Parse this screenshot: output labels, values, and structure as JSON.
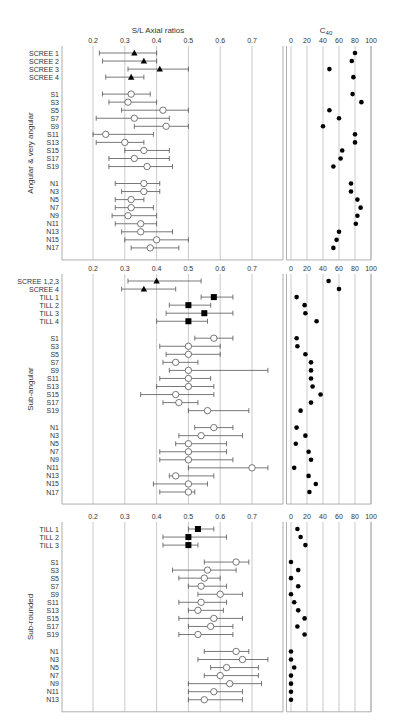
{
  "chart_data": {
    "type": "scatter",
    "title_left": "S/L Axial ratios",
    "title_right": "C40",
    "title_right_main": "C",
    "title_right_sub": "40",
    "left_axis": {
      "min": 0.2,
      "max": 0.7,
      "ticks": [
        0.2,
        0.3,
        0.4,
        0.5,
        0.6,
        0.7
      ],
      "tick_labels": [
        "0.2",
        "0.3",
        "0.4",
        "0.5",
        "0.6",
        "0.7"
      ]
    },
    "right_axis": {
      "min": 0,
      "max": 100,
      "ticks": [
        0,
        20,
        40,
        60,
        80,
        100
      ],
      "tick_labels": [
        "0",
        "20",
        "40",
        "60",
        "80",
        "100"
      ]
    },
    "grid": true,
    "marker_legend": {
      "triangle": "SCREE",
      "square": "TILL",
      "open-circle": "S / N samples",
      "dot": "C40"
    },
    "panels": [
      {
        "group_label": "Angular & very angular",
        "rows": [
          {
            "label": "SCREE 1",
            "marker": "triangle",
            "ratio": 0.33,
            "lo": 0.22,
            "hi": 0.4,
            "c40": 80
          },
          {
            "label": "SCREE 2",
            "marker": "triangle",
            "ratio": 0.36,
            "lo": 0.23,
            "hi": 0.4,
            "c40": 76
          },
          {
            "label": "SCREE 3",
            "marker": "triangle",
            "ratio": 0.41,
            "lo": 0.31,
            "hi": 0.5,
            "c40": 48
          },
          {
            "label": "SCREE 4",
            "marker": "triangle",
            "ratio": 0.32,
            "lo": 0.24,
            "hi": 0.36,
            "c40": 78
          },
          {
            "gap": true
          },
          {
            "label": "S1",
            "marker": "circle",
            "ratio": 0.32,
            "lo": 0.23,
            "hi": 0.38,
            "c40": 77
          },
          {
            "label": "S3",
            "marker": "circle",
            "ratio": 0.31,
            "lo": 0.25,
            "hi": 0.4,
            "c40": 88
          },
          {
            "label": "S5",
            "marker": "circle",
            "ratio": 0.42,
            "lo": 0.29,
            "hi": 0.5,
            "c40": 48
          },
          {
            "label": "S7",
            "marker": "circle",
            "ratio": 0.33,
            "lo": 0.21,
            "hi": 0.44,
            "c40": 60
          },
          {
            "label": "S9",
            "marker": "circle",
            "ratio": 0.43,
            "lo": 0.33,
            "hi": 0.5,
            "c40": 40
          },
          {
            "label": "S11",
            "marker": "circle",
            "ratio": 0.24,
            "lo": 0.2,
            "hi": 0.39,
            "c40": 80
          },
          {
            "label": "S13",
            "marker": "circle",
            "ratio": 0.3,
            "lo": 0.21,
            "hi": 0.36,
            "c40": 80
          },
          {
            "label": "S15",
            "marker": "circle",
            "ratio": 0.36,
            "lo": 0.3,
            "hi": 0.44,
            "c40": 64
          },
          {
            "label": "S17",
            "marker": "circle",
            "ratio": 0.33,
            "lo": 0.25,
            "hi": 0.44,
            "c40": 62
          },
          {
            "label": "S19",
            "marker": "circle",
            "ratio": 0.37,
            "lo": 0.25,
            "hi": 0.45,
            "c40": 53
          },
          {
            "gap": true
          },
          {
            "label": "N1",
            "marker": "circle",
            "ratio": 0.36,
            "lo": 0.27,
            "hi": 0.41,
            "c40": 75
          },
          {
            "label": "N3",
            "marker": "circle",
            "ratio": 0.36,
            "lo": 0.29,
            "hi": 0.41,
            "c40": 75
          },
          {
            "label": "N5",
            "marker": "circle",
            "ratio": 0.32,
            "lo": 0.27,
            "hi": 0.36,
            "c40": 83
          },
          {
            "label": "N7",
            "marker": "circle",
            "ratio": 0.32,
            "lo": 0.27,
            "hi": 0.39,
            "c40": 87
          },
          {
            "label": "N9",
            "marker": "circle",
            "ratio": 0.31,
            "lo": 0.26,
            "hi": 0.4,
            "c40": 83
          },
          {
            "label": "N11",
            "marker": "circle",
            "ratio": 0.35,
            "lo": 0.27,
            "hi": 0.4,
            "c40": 81
          },
          {
            "label": "N13",
            "marker": "circle",
            "ratio": 0.35,
            "lo": 0.29,
            "hi": 0.45,
            "c40": 60
          },
          {
            "label": "N15",
            "marker": "circle",
            "ratio": 0.4,
            "lo": 0.3,
            "hi": 0.5,
            "c40": 57
          },
          {
            "label": "N17",
            "marker": "circle",
            "ratio": 0.38,
            "lo": 0.32,
            "hi": 0.47,
            "c40": 53
          }
        ]
      },
      {
        "group_label": "Sub-angular",
        "rows": [
          {
            "label": "SCREE 1,2,3",
            "marker": "triangle",
            "ratio": 0.4,
            "lo": 0.31,
            "hi": 0.54,
            "c40": 47
          },
          {
            "label": "SCREE 4",
            "marker": "triangle",
            "ratio": 0.36,
            "lo": 0.29,
            "hi": 0.46,
            "c40": 60
          },
          {
            "label": "TILL 1",
            "marker": "square",
            "ratio": 0.58,
            "lo": 0.54,
            "hi": 0.64,
            "c40": 7
          },
          {
            "label": "TILL 2",
            "marker": "square",
            "ratio": 0.5,
            "lo": 0.44,
            "hi": 0.57,
            "c40": 17
          },
          {
            "label": "TILL 3",
            "marker": "square",
            "ratio": 0.55,
            "lo": 0.43,
            "hi": 0.64,
            "c40": 18
          },
          {
            "label": "TILL 4",
            "marker": "square",
            "ratio": 0.5,
            "lo": 0.4,
            "hi": 0.56,
            "c40": 32
          },
          {
            "gap": true
          },
          {
            "label": "S1",
            "marker": "circle",
            "ratio": 0.58,
            "lo": 0.52,
            "hi": 0.64,
            "c40": 7
          },
          {
            "label": "S3",
            "marker": "circle",
            "ratio": 0.5,
            "lo": 0.41,
            "hi": 0.6,
            "c40": 8
          },
          {
            "label": "S5",
            "marker": "circle",
            "ratio": 0.5,
            "lo": 0.43,
            "hi": 0.6,
            "c40": 18
          },
          {
            "label": "S7",
            "marker": "circle",
            "ratio": 0.46,
            "lo": 0.42,
            "hi": 0.53,
            "c40": 25
          },
          {
            "label": "S9",
            "marker": "circle",
            "ratio": 0.5,
            "lo": 0.44,
            "hi": 0.75,
            "c40": 25
          },
          {
            "label": "S11",
            "marker": "circle",
            "ratio": 0.5,
            "lo": 0.41,
            "hi": 0.57,
            "c40": 25
          },
          {
            "label": "S13",
            "marker": "circle",
            "ratio": 0.5,
            "lo": 0.4,
            "hi": 0.58,
            "c40": 27
          },
          {
            "label": "S15",
            "marker": "circle",
            "ratio": 0.46,
            "lo": 0.35,
            "hi": 0.58,
            "c40": 37
          },
          {
            "label": "S17",
            "marker": "circle",
            "ratio": 0.47,
            "lo": 0.42,
            "hi": 0.53,
            "c40": 25
          },
          {
            "label": "S19",
            "marker": "circle",
            "ratio": 0.56,
            "lo": 0.5,
            "hi": 0.69,
            "c40": 12
          },
          {
            "gap": true
          },
          {
            "label": "N1",
            "marker": "circle",
            "ratio": 0.58,
            "lo": 0.52,
            "hi": 0.64,
            "c40": 7
          },
          {
            "label": "N3",
            "marker": "circle",
            "ratio": 0.54,
            "lo": 0.47,
            "hi": 0.67,
            "c40": 18
          },
          {
            "label": "N5",
            "marker": "circle",
            "ratio": 0.5,
            "lo": 0.46,
            "hi": 0.62,
            "c40": 6
          },
          {
            "label": "N7",
            "marker": "circle",
            "ratio": 0.5,
            "lo": 0.41,
            "hi": 0.62,
            "c40": 22
          },
          {
            "label": "N9",
            "marker": "circle",
            "ratio": 0.5,
            "lo": 0.41,
            "hi": 0.64,
            "c40": 25
          },
          {
            "label": "N11",
            "marker": "circle",
            "ratio": 0.7,
            "lo": 0.5,
            "hi": 0.75,
            "c40": 4
          },
          {
            "label": "N13",
            "marker": "circle",
            "ratio": 0.46,
            "lo": 0.44,
            "hi": 0.58,
            "c40": 22
          },
          {
            "label": "N15",
            "marker": "circle",
            "ratio": 0.5,
            "lo": 0.39,
            "hi": 0.56,
            "c40": 31
          },
          {
            "label": "N17",
            "marker": "circle",
            "ratio": 0.5,
            "lo": 0.41,
            "hi": 0.52,
            "c40": 23
          }
        ]
      },
      {
        "group_label": "Sub-rounded",
        "rows": [
          {
            "label": "TILL 1",
            "marker": "square",
            "ratio": 0.53,
            "lo": 0.5,
            "hi": 0.58,
            "c40": 8
          },
          {
            "label": "TILL 2",
            "marker": "square",
            "ratio": 0.5,
            "lo": 0.42,
            "hi": 0.62,
            "c40": 12
          },
          {
            "label": "TILL 3",
            "marker": "square",
            "ratio": 0.5,
            "lo": 0.42,
            "hi": 0.53,
            "c40": 18
          },
          {
            "gap": true
          },
          {
            "label": "S1",
            "marker": "circle",
            "ratio": 0.65,
            "lo": 0.55,
            "hi": 0.69,
            "c40": 0
          },
          {
            "label": "S3",
            "marker": "circle",
            "ratio": 0.56,
            "lo": 0.45,
            "hi": 0.65,
            "c40": 9
          },
          {
            "label": "S5",
            "marker": "circle",
            "ratio": 0.55,
            "lo": 0.47,
            "hi": 0.6,
            "c40": 0
          },
          {
            "label": "S7",
            "marker": "circle",
            "ratio": 0.54,
            "lo": 0.5,
            "hi": 0.62,
            "c40": 9
          },
          {
            "label": "S9",
            "marker": "circle",
            "ratio": 0.6,
            "lo": 0.53,
            "hi": 0.67,
            "c40": 0
          },
          {
            "label": "S11",
            "marker": "circle",
            "ratio": 0.54,
            "lo": 0.47,
            "hi": 0.62,
            "c40": 4
          },
          {
            "label": "S13",
            "marker": "circle",
            "ratio": 0.53,
            "lo": 0.5,
            "hi": 0.61,
            "c40": 9
          },
          {
            "label": "S15",
            "marker": "circle",
            "ratio": 0.58,
            "lo": 0.47,
            "hi": 0.67,
            "c40": 17
          },
          {
            "label": "S17",
            "marker": "circle",
            "ratio": 0.57,
            "lo": 0.5,
            "hi": 0.64,
            "c40": 8
          },
          {
            "label": "S19",
            "marker": "circle",
            "ratio": 0.53,
            "lo": 0.47,
            "hi": 0.64,
            "c40": 17
          },
          {
            "gap": true
          },
          {
            "label": "N1",
            "marker": "circle",
            "ratio": 0.65,
            "lo": 0.55,
            "hi": 0.69,
            "c40": 0
          },
          {
            "label": "N3",
            "marker": "circle",
            "ratio": 0.67,
            "lo": 0.53,
            "hi": 0.75,
            "c40": 0
          },
          {
            "label": "N5",
            "marker": "circle",
            "ratio": 0.62,
            "lo": 0.57,
            "hi": 0.72,
            "c40": 4
          },
          {
            "label": "N7",
            "marker": "circle",
            "ratio": 0.6,
            "lo": 0.55,
            "hi": 0.72,
            "c40": 0
          },
          {
            "label": "N9",
            "marker": "circle",
            "ratio": 0.63,
            "lo": 0.5,
            "hi": 0.73,
            "c40": 0
          },
          {
            "label": "N11",
            "marker": "circle",
            "ratio": 0.58,
            "lo": 0.5,
            "hi": 0.67,
            "c40": 0
          },
          {
            "label": "N13",
            "marker": "circle",
            "ratio": 0.55,
            "lo": 0.5,
            "hi": 0.67,
            "c40": 0
          }
        ]
      }
    ]
  },
  "layout_hints": {
    "panel_tops": [
      46,
      274,
      522
    ],
    "row_height": 8.05,
    "gap_height": 8.9
  },
  "colors": {
    "grid": "#bdbdbd",
    "frame": "#9a9a9a",
    "marker": "#000000",
    "text": "#333333"
  }
}
